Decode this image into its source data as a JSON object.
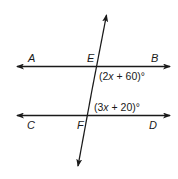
{
  "diagram": {
    "type": "parallel-lines-transversal",
    "colors": {
      "stroke": "#1a1a1a",
      "background": "#ffffff"
    },
    "lines": [
      {
        "name": "AB",
        "from": "A",
        "to": "B",
        "arrows": "both"
      },
      {
        "name": "CD",
        "from": "C",
        "to": "D",
        "arrows": "both"
      },
      {
        "name": "transversal",
        "through": [
          "E",
          "F"
        ],
        "arrows": "both"
      }
    ],
    "points": {
      "A": "A",
      "B": "B",
      "C": "C",
      "D": "D",
      "E": "E",
      "F": "F"
    },
    "angles": {
      "at_E": {
        "prefix": "(2",
        "var": "x",
        "suffix": " + 60)°",
        "position": "below-right of E"
      },
      "at_F": {
        "prefix": "(3",
        "var": "x",
        "suffix": " + 20)°",
        "position": "above-right of F"
      }
    }
  }
}
